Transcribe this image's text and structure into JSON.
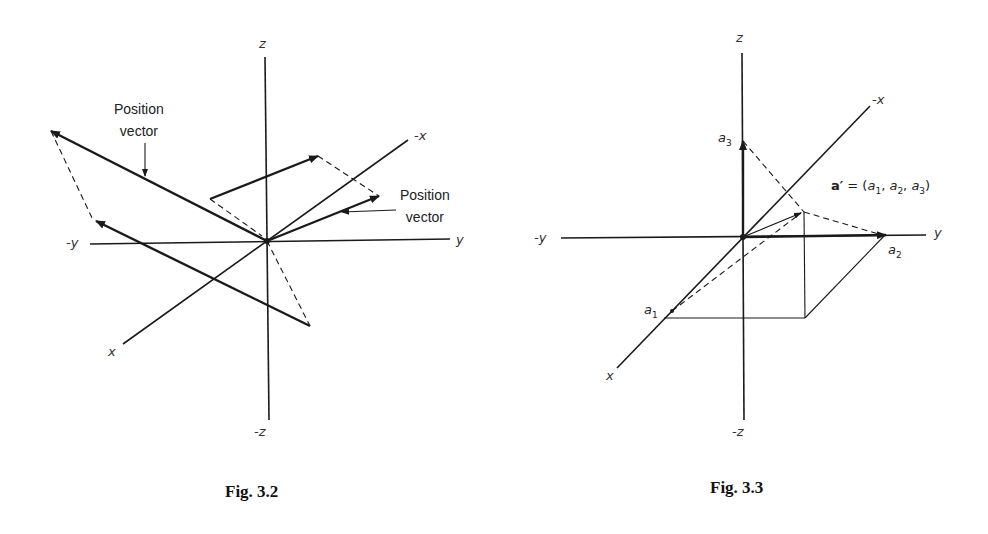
{
  "figures": [
    {
      "caption": "Fig. 3.2",
      "axes": {
        "z": "z",
        "neg_z": "-z",
        "y": "y",
        "neg_y": "-y",
        "x": "x",
        "neg_x": "-x"
      },
      "annotations": [
        {
          "text_line1": "Position",
          "text_line2": "vector"
        },
        {
          "text_line1": "Position",
          "text_line2": "vector"
        }
      ]
    },
    {
      "caption": "Fig. 3.3",
      "axes": {
        "z": "z",
        "neg_z": "-z",
        "y": "y",
        "neg_y": "-y",
        "x": "x",
        "neg_x": "-x"
      },
      "points": {
        "a1": "a",
        "a1_sub": "1",
        "a2": "a",
        "a2_sub": "2",
        "a3": "a",
        "a3_sub": "3"
      },
      "formula": {
        "lhs": "a′",
        "eq": " = (",
        "c1": "a",
        "s1": "1",
        "sep1": ", ",
        "c2": "a",
        "s2": "2",
        "sep2": ", ",
        "c3": "a",
        "s3": "3",
        "close": ")"
      }
    }
  ]
}
